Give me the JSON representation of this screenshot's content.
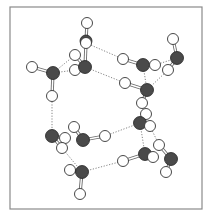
{
  "diagram": {
    "type": "molecular-structure",
    "frame": {
      "x": 10,
      "y": 7,
      "w": 192,
      "h": 202,
      "color": "#8a8a8a"
    },
    "colors": {
      "oxygen": "#4a4a4a",
      "hydrogen": "#ffffff",
      "hbond": "#777777",
      "bond": "#6a6a6a"
    },
    "atoms": [
      {
        "id": "O1",
        "el": "O",
        "x": 53,
        "y": 73,
        "r": 6.5
      },
      {
        "id": "H1a",
        "el": "H",
        "x": 32,
        "y": 67,
        "r": 5.5
      },
      {
        "id": "H1b",
        "el": "H",
        "x": 52,
        "y": 96,
        "r": 5.5
      },
      {
        "id": "H2a",
        "el": "H",
        "x": 87,
        "y": 23,
        "r": 5.5
      },
      {
        "id": "O2back",
        "el": "O",
        "x": 86,
        "y": 41,
        "r": 6.0
      },
      {
        "id": "H2b",
        "el": "H",
        "x": 86,
        "y": 43,
        "r": 5.5
      },
      {
        "id": "H3a",
        "el": "H",
        "x": 75,
        "y": 55,
        "r": 5.5
      },
      {
        "id": "H3b",
        "el": "H",
        "x": 75,
        "y": 70,
        "r": 5.5
      },
      {
        "id": "O3",
        "el": "O",
        "x": 85,
        "y": 67,
        "r": 6.5
      },
      {
        "id": "H4a",
        "el": "H",
        "x": 123,
        "y": 59,
        "r": 5.5
      },
      {
        "id": "O4",
        "el": "O",
        "x": 143,
        "y": 65,
        "r": 6.5
      },
      {
        "id": "H4b",
        "el": "H",
        "x": 155,
        "y": 65,
        "r": 5.5
      },
      {
        "id": "H5a",
        "el": "H",
        "x": 173,
        "y": 39,
        "r": 5.5
      },
      {
        "id": "O5",
        "el": "O",
        "x": 177,
        "y": 58,
        "r": 6.5
      },
      {
        "id": "H5b",
        "el": "H",
        "x": 168,
        "y": 70,
        "r": 5.5
      },
      {
        "id": "H6a",
        "el": "H",
        "x": 125,
        "y": 83,
        "r": 5.5
      },
      {
        "id": "O6",
        "el": "O",
        "x": 147,
        "y": 90,
        "r": 6.5
      },
      {
        "id": "H6b",
        "el": "H",
        "x": 142,
        "y": 103,
        "r": 5.5
      },
      {
        "id": "H7a",
        "el": "H",
        "x": 146,
        "y": 114,
        "r": 5.5
      },
      {
        "id": "O7",
        "el": "O",
        "x": 140,
        "y": 123,
        "r": 6.5
      },
      {
        "id": "H7b",
        "el": "H",
        "x": 150,
        "y": 126,
        "r": 5.5
      },
      {
        "id": "H8a",
        "el": "H",
        "x": 159,
        "y": 145,
        "r": 5.5
      },
      {
        "id": "H8b",
        "el": "H",
        "x": 123,
        "y": 161,
        "r": 5.5
      },
      {
        "id": "O8",
        "el": "O",
        "x": 145,
        "y": 154,
        "r": 6.5
      },
      {
        "id": "H8c",
        "el": "H",
        "x": 153,
        "y": 157,
        "r": 5.5
      },
      {
        "id": "O9",
        "el": "O",
        "x": 171,
        "y": 159,
        "r": 6.5
      },
      {
        "id": "H9a",
        "el": "H",
        "x": 166,
        "y": 172,
        "r": 5.5
      },
      {
        "id": "O10",
        "el": "O",
        "x": 52,
        "y": 136,
        "r": 6.5
      },
      {
        "id": "H10a",
        "el": "H",
        "x": 65,
        "y": 138,
        "r": 5.5
      },
      {
        "id": "H10b",
        "el": "H",
        "x": 62,
        "y": 148,
        "r": 5.5
      },
      {
        "id": "H11a",
        "el": "H",
        "x": 74,
        "y": 127,
        "r": 5.5
      },
      {
        "id": "O11",
        "el": "O",
        "x": 83,
        "y": 140,
        "r": 6.5
      },
      {
        "id": "H11b",
        "el": "H",
        "x": 105,
        "y": 136,
        "r": 5.5
      },
      {
        "id": "H12a",
        "el": "H",
        "x": 70,
        "y": 170,
        "r": 5.5
      },
      {
        "id": "O12",
        "el": "O",
        "x": 82,
        "y": 172,
        "r": 6.5
      },
      {
        "id": "H12b",
        "el": "H",
        "x": 80,
        "y": 194,
        "r": 5.5
      }
    ],
    "bonds": [
      [
        "O1",
        "H1a"
      ],
      [
        "O1",
        "H1b"
      ],
      [
        "O2back",
        "H2a"
      ],
      [
        "O3",
        "H2b"
      ],
      [
        "O3",
        "H3a"
      ],
      [
        "O4",
        "H4a"
      ],
      [
        "O4",
        "H4b"
      ],
      [
        "O5",
        "H5a"
      ],
      [
        "O5",
        "H5b"
      ],
      [
        "O6",
        "H6a"
      ],
      [
        "O6",
        "H6b"
      ],
      [
        "O7",
        "H7a"
      ],
      [
        "O7",
        "H7b"
      ],
      [
        "O8",
        "H8b"
      ],
      [
        "O8",
        "H8c"
      ],
      [
        "O9",
        "H8a"
      ],
      [
        "O9",
        "H9a"
      ],
      [
        "O10",
        "H10a"
      ],
      [
        "O10",
        "H10b"
      ],
      [
        "O11",
        "H11a"
      ],
      [
        "O11",
        "H11b"
      ],
      [
        "O12",
        "H12a"
      ],
      [
        "O12",
        "H12b"
      ]
    ],
    "hbonds": [
      [
        "O1",
        "H3a"
      ],
      [
        "O1",
        "H3b"
      ],
      [
        "H2b",
        "H4a"
      ],
      [
        "O3",
        "H6a"
      ],
      [
        "O4",
        "O6"
      ],
      [
        "H4b",
        "O5"
      ],
      [
        "H5b",
        "O6"
      ],
      [
        "H1b",
        "O10"
      ],
      [
        "O7",
        "O8"
      ],
      [
        "H7b",
        "H8a"
      ],
      [
        "H11b",
        "O7"
      ],
      [
        "H10b",
        "O12"
      ],
      [
        "O12",
        "H8b"
      ]
    ]
  }
}
